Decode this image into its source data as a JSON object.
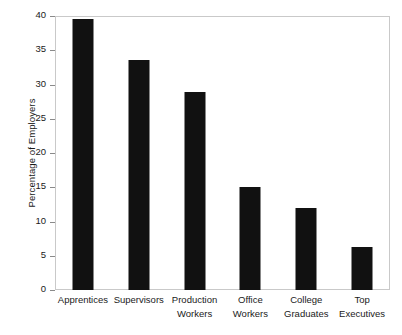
{
  "chart_data": {
    "type": "bar",
    "title": "",
    "xlabel": "",
    "ylabel": "Percentage of Employers",
    "ylim": [
      0,
      40
    ],
    "yticks": [
      0,
      5,
      10,
      15,
      20,
      25,
      30,
      35,
      40
    ],
    "ytick_labels": [
      "0",
      "5",
      "10",
      "15",
      "20",
      "25",
      "30",
      "35",
      "40"
    ],
    "grid": false,
    "legend": null,
    "bar_color": "#111111",
    "frame_color": "#c9c9c9",
    "categories": [
      "Apprentices",
      "Supervisors",
      "Production Workers",
      "Office Workers",
      "College Graduates",
      "Top Executives"
    ],
    "category_lines": [
      [
        "Apprentices",
        ""
      ],
      [
        "Supervisors",
        ""
      ],
      [
        "Production",
        "Workers"
      ],
      [
        "Office",
        "Workers"
      ],
      [
        "College",
        "Graduates"
      ],
      [
        "Top",
        "Executives"
      ]
    ],
    "values": [
      39.6,
      33.6,
      28.9,
      15.0,
      12.0,
      6.3
    ]
  }
}
